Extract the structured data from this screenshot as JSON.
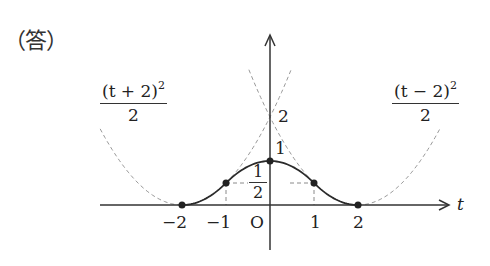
{
  "header": {
    "answer_label": "（答）"
  },
  "axes": {
    "x_label": "t",
    "origin_label": "O",
    "x_ticks": [
      "−2",
      "−1",
      "1",
      "2"
    ],
    "y_ticks": {
      "one": "1",
      "two": "2",
      "half_num": "1",
      "half_den": "2"
    }
  },
  "annotations": {
    "left_curve": {
      "numerator": "(t + 2)",
      "exponent": "2",
      "denominator": "2"
    },
    "right_curve": {
      "numerator": "(t − 2)",
      "exponent": "2",
      "denominator": "2"
    }
  },
  "chart_data": {
    "type": "line",
    "title": "",
    "xlabel": "t",
    "ylabel": "",
    "series": [
      {
        "name": "f(t) piecewise (solid)",
        "style": "solid",
        "pieces": [
          {
            "domain": [
              -2,
              -1
            ],
            "expr": "(t+2)^2/2"
          },
          {
            "domain": [
              -1,
              1
            ],
            "expr": "1 - t^2/2"
          },
          {
            "domain": [
              1,
              2
            ],
            "expr": "(t-2)^2/2"
          }
        ],
        "x": [
          -2,
          -1,
          0,
          1,
          2
        ],
        "y": [
          0,
          0.5,
          1,
          0.5,
          0
        ]
      },
      {
        "name": "(t+2)^2/2",
        "style": "dashed"
      },
      {
        "name": "(t-2)^2/2",
        "style": "dashed"
      }
    ],
    "points": [
      [
        -2,
        0
      ],
      [
        -1,
        0.5
      ],
      [
        0,
        1
      ],
      [
        1,
        0.5
      ],
      [
        2,
        0
      ]
    ],
    "guides": [
      "dashed vertical at t=-1 and t=1 to y=1/2",
      "dashed horizontal y=1/2"
    ],
    "y_marks": [
      0.5,
      1,
      2
    ],
    "x_ticks": [
      -2,
      -1,
      0,
      1,
      2
    ],
    "colors": {
      "axis": "#333333",
      "curve": "#2a2a2a",
      "dashed": "#9a9a9a"
    }
  }
}
